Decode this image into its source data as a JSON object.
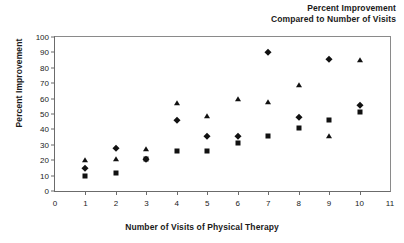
{
  "chart_data": {
    "type": "scatter",
    "title": "Percent Improvement\nCompared to Number of Visits",
    "title_line1": "Percent Improvement",
    "title_line2": "Compared to Number of Visits",
    "xlabel": "Number of Visits of Physical Therapy",
    "ylabel": "Percent Improvement",
    "xlim": [
      0,
      11
    ],
    "ylim": [
      0,
      100
    ],
    "xticks": [
      0,
      1,
      2,
      3,
      4,
      5,
      6,
      7,
      8,
      9,
      10,
      11
    ],
    "yticks": [
      0,
      10,
      20,
      30,
      40,
      50,
      60,
      70,
      80,
      90,
      100
    ],
    "grid": false,
    "legend": "none",
    "x": [
      1,
      2,
      3,
      4,
      5,
      6,
      7,
      8,
      9,
      10
    ],
    "series": [
      {
        "name": "Series A",
        "marker": "square",
        "values": [
          10,
          12,
          21,
          26,
          26,
          31,
          36,
          41,
          46,
          51
        ]
      },
      {
        "name": "Series B",
        "marker": "diamond",
        "values": [
          15,
          28,
          21,
          46,
          36,
          36,
          90,
          48,
          86,
          56
        ]
      },
      {
        "name": "Series C",
        "marker": "triangle",
        "values": [
          20,
          21,
          27,
          57,
          49,
          60,
          58,
          69,
          36,
          85
        ]
      }
    ]
  }
}
